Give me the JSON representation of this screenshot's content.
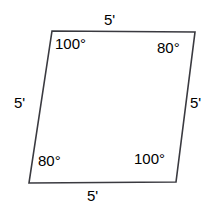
{
  "figure": {
    "type": "parallelogram",
    "stroke_color": "#3a3a40",
    "fill_color": "#ffffff",
    "background_color": "#ffffff",
    "text_color": "#000000",
    "stroke_width": 1.6,
    "vertices": {
      "top_left": {
        "x": 52,
        "y": 31
      },
      "top_right": {
        "x": 195,
        "y": 32
      },
      "bottom_right": {
        "x": 176,
        "y": 182
      },
      "bottom_left": {
        "x": 29,
        "y": 183
      }
    },
    "polygon_points": "52,31 195,32 176,182 29,183",
    "sides": [
      {
        "position": "top",
        "label": "5'"
      },
      {
        "position": "right",
        "label": "5'"
      },
      {
        "position": "bottom",
        "label": "5'"
      },
      {
        "position": "left",
        "label": "5'"
      }
    ],
    "angles": [
      {
        "vertex": "top_left",
        "label": "100°",
        "value": 100
      },
      {
        "vertex": "top_right",
        "label": "80°",
        "value": 80
      },
      {
        "vertex": "bottom_right",
        "label": "100°",
        "value": 100
      },
      {
        "vertex": "bottom_left",
        "label": "80°",
        "value": 80
      }
    ]
  }
}
